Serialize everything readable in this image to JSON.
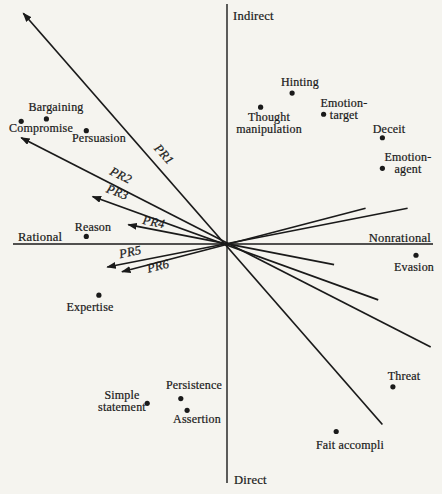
{
  "style": {
    "paper": "#f5f4ef",
    "ink": "#1a1a1a"
  },
  "chart_data": {
    "type": "scatter",
    "title": "",
    "legend": "none",
    "grid": false,
    "x_axis": {
      "left_label": "Rational",
      "right_label": "Nonrational",
      "range": [
        -1,
        1
      ]
    },
    "y_axis": {
      "top_label": "Indirect",
      "bottom_label": "Direct",
      "range": [
        -1,
        1
      ]
    },
    "axis_labels": {
      "top": "Indirect",
      "bottom": "Direct",
      "left": "Rational",
      "right": "Nonrational"
    },
    "points": [
      {
        "label": "Bargaining",
        "x": -0.86,
        "y": 0.53,
        "label_lines": [
          "Bargaining"
        ],
        "label_px": [
          56,
          111
        ],
        "anchor": "middle"
      },
      {
        "label": "Compromise",
        "x": -0.98,
        "y": 0.52,
        "label_lines": [
          "Compromise"
        ],
        "label_px": [
          41,
          132
        ],
        "anchor": "middle"
      },
      {
        "label": "Persuasion",
        "x": -0.67,
        "y": 0.48,
        "label_lines": [
          "Persuasion"
        ],
        "label_px": [
          99,
          142
        ],
        "anchor": "middle"
      },
      {
        "label": "Hinting",
        "x": 0.31,
        "y": 0.64,
        "label_lines": [
          "Hinting"
        ],
        "label_px": [
          300,
          86
        ],
        "anchor": "middle"
      },
      {
        "label": "Thought manipulation",
        "x": 0.16,
        "y": 0.58,
        "label_lines": [
          "Thought",
          "manipulation"
        ],
        "label_px": [
          269,
          121
        ],
        "anchor": "middle"
      },
      {
        "label": "Emotion-target",
        "x": 0.46,
        "y": 0.55,
        "label_lines": [
          "Emotion-",
          "target"
        ],
        "label_px": [
          344,
          107
        ],
        "anchor": "middle"
      },
      {
        "label": "Deceit",
        "x": 0.74,
        "y": 0.45,
        "label_lines": [
          "Deceit"
        ],
        "label_px": [
          389,
          133
        ],
        "anchor": "middle"
      },
      {
        "label": "Emotion-agent",
        "x": 0.74,
        "y": 0.32,
        "label_lines": [
          "Emotion-",
          "agent"
        ],
        "label_px": [
          408,
          161
        ],
        "anchor": "middle"
      },
      {
        "label": "Reason",
        "x": -0.67,
        "y": 0.03,
        "label_lines": [
          "Reason"
        ],
        "label_px": [
          93,
          231
        ],
        "anchor": "middle"
      },
      {
        "label": "Expertise",
        "x": -0.61,
        "y": -0.22,
        "label_lines": [
          "Expertise"
        ],
        "label_px": [
          90,
          311
        ],
        "anchor": "middle"
      },
      {
        "label": "Evasion",
        "x": 0.9,
        "y": -0.05,
        "label_lines": [
          "Evasion"
        ],
        "label_px": [
          414,
          271
        ],
        "anchor": "middle"
      },
      {
        "label": "Simple statement",
        "x": -0.38,
        "y": -0.68,
        "label_lines": [
          "Simple",
          "statement"
        ],
        "label_px": [
          122,
          399
        ],
        "anchor": "middle"
      },
      {
        "label": "Persistence",
        "x": -0.22,
        "y": -0.66,
        "label_lines": [
          "Persistence"
        ],
        "label_px": [
          194,
          389
        ],
        "anchor": "middle"
      },
      {
        "label": "Assertion",
        "x": -0.19,
        "y": -0.71,
        "label_lines": [
          "Assertion"
        ],
        "label_px": [
          197,
          423
        ],
        "anchor": "middle"
      },
      {
        "label": "Threat",
        "x": 0.79,
        "y": -0.61,
        "label_lines": [
          "Threat"
        ],
        "label_px": [
          404,
          380
        ],
        "anchor": "middle"
      },
      {
        "label": "Fait accompli",
        "x": 0.52,
        "y": -0.8,
        "label_lines": [
          "Fait accompli"
        ],
        "label_px": [
          350,
          449
        ],
        "anchor": "middle"
      }
    ],
    "vectors": [
      {
        "label": "PR1",
        "tip": [
          -0.97,
          0.98
        ],
        "tail": [
          0.74,
          -0.77
        ],
        "label_px": [
          161,
          157
        ],
        "angle": 48
      },
      {
        "label": "PR2",
        "tip": [
          -0.98,
          0.45
        ],
        "tail": [
          0.97,
          -0.44
        ],
        "label_px": [
          119,
          179
        ],
        "angle": 27
      },
      {
        "label": "PR3",
        "tip": [
          -0.64,
          0.2
        ],
        "tail": [
          0.72,
          -0.24
        ],
        "label_px": [
          116,
          196
        ],
        "angle": 21
      },
      {
        "label": "PR4",
        "tip": [
          -0.47,
          0.08
        ],
        "tail": [
          0.51,
          -0.09
        ],
        "label_px": [
          153,
          226
        ],
        "angle": 11
      },
      {
        "label": "PR5",
        "tip": [
          -0.57,
          -0.1
        ],
        "tail": [
          0.86,
          0.15
        ],
        "label_px": [
          131,
          256
        ],
        "angle": -11
      },
      {
        "label": "PR6",
        "tip": [
          -0.5,
          -0.12
        ],
        "tail": [
          0.66,
          0.15
        ],
        "label_px": [
          159,
          270
        ],
        "angle": -14
      }
    ],
    "layout_hints": {
      "origin_px": [
        227,
        243.5
      ],
      "scale_px": [
        210,
        235
      ],
      "h_axis_px": {
        "y": 244,
        "x0": 13,
        "x1": 433
      },
      "v_axis_px": {
        "x": 227,
        "y0": 4,
        "y1": 483
      },
      "axis_label_px": {
        "top": {
          "x": 233,
          "y": 20,
          "anchor": "start"
        },
        "bottom": {
          "x": 234,
          "y": 484,
          "anchor": "start"
        },
        "left": {
          "x": 18,
          "y": 241,
          "anchor": "start"
        },
        "right": {
          "x": 431,
          "y": 242,
          "anchor": "end"
        }
      },
      "line_gap_px": 12,
      "dot_radius_px": 2.6
    }
  }
}
